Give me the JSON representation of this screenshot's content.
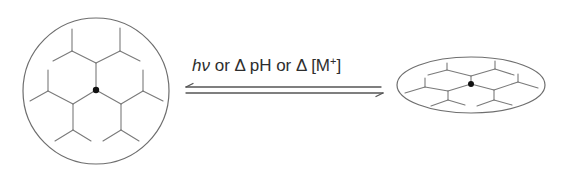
{
  "diagram": {
    "condition_label": {
      "hv": "hν",
      "or1": " or ",
      "delta1": "Δ",
      "ph": " pH",
      "or2": " or ",
      "delta2": "Δ",
      "ion_open": " [M",
      "ion_charge": "+",
      "ion_close": "]"
    },
    "left_state": {
      "shape": "circle",
      "description": "swollen network (expanded)",
      "center": [
        96,
        91
      ],
      "radius": 73
    },
    "right_state": {
      "shape": "ellipse",
      "description": "collapsed network (contracted)",
      "center": [
        471,
        85
      ],
      "rx": 74,
      "ry": 28
    },
    "arrows": {
      "type": "equilibrium-harpoons",
      "forward_direction": "right",
      "reverse_direction": "left"
    },
    "colors": {
      "lines": "#7a7a7a",
      "outline": "#6e6e6e",
      "text": "#2e2e2e",
      "crosslink_dot": "#111111"
    }
  }
}
